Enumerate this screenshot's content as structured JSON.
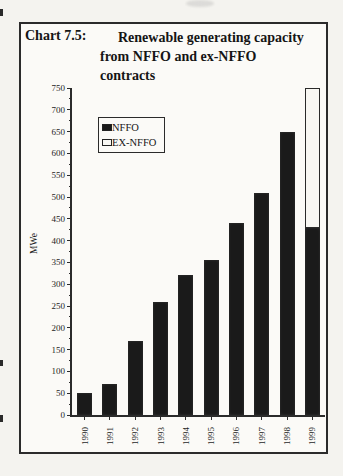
{
  "title": {
    "label": "Chart 7.5:",
    "lines": [
      "Renewable generating capacity",
      "from NFFO and ex-NFFO",
      "contracts"
    ]
  },
  "chart_data": {
    "type": "bar",
    "stacked": true,
    "title": "Chart 7.5: Renewable generating capacity from NFFO and ex-NFFO contracts",
    "xlabel": "",
    "ylabel": "MWe",
    "categories": [
      "1990",
      "1991",
      "1992",
      "1993",
      "1994",
      "1995",
      "1996",
      "1997",
      "1998",
      "1999"
    ],
    "series": [
      {
        "name": "NFFO",
        "color": "#1a1a1a",
        "values": [
          50,
          70,
          170,
          260,
          320,
          355,
          440,
          510,
          650,
          430
        ]
      },
      {
        "name": "EX-NFFO",
        "color": "#f8f7f3",
        "values": [
          0,
          0,
          0,
          0,
          0,
          0,
          0,
          0,
          0,
          320
        ]
      }
    ],
    "ylim": [
      0,
      750
    ],
    "yticks": [
      0,
      50,
      100,
      150,
      200,
      250,
      300,
      350,
      400,
      450,
      500,
      550,
      600,
      650,
      700,
      750
    ],
    "ytick_minor_step": 25,
    "grid": false,
    "legend_position": "upper-left-inside",
    "bar_width_px": 15
  },
  "colors": {
    "ink": "#2b2b2b",
    "paper": "#f4f3ef",
    "frame_background": "#fbfaf7",
    "bar_dark": "#1a1a1a",
    "bar_light": "#f8f7f3"
  }
}
